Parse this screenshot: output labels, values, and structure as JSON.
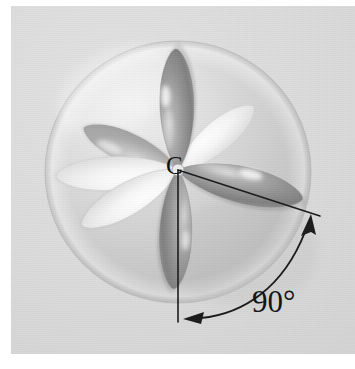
{
  "figure": {
    "kind": "molecular-orbital-illustration",
    "background_color": "#d8d8d8",
    "plate_border_color": "#ffffff"
  },
  "labels": {
    "center_atom": "C",
    "angle": "90°"
  },
  "annotations": {
    "vertical_reference_line": {
      "name": "vertical-reference-line",
      "from": [
        178,
        170
      ],
      "to": [
        178,
        322
      ],
      "color": "#1a1a1a"
    },
    "diagonal_bond_line": {
      "name": "diagonal-bond-line",
      "from": [
        178,
        170
      ],
      "to": [
        320,
        216
      ],
      "color": "#1a1a1a"
    },
    "angle_arc": {
      "name": "angle-arc",
      "start": [
        196,
        318
      ],
      "end": [
        308,
        224
      ],
      "arrowheads": [
        "start",
        "end"
      ],
      "color": "#1a1a1a",
      "measure": "90°"
    }
  },
  "sphere": {
    "name": "valence-sphere",
    "center": [
      178,
      172
    ],
    "radius_x": 132,
    "radius_y": 130,
    "fill": "#d0d0d0",
    "highlight": "#f0f0f0"
  },
  "lobes": [
    {
      "name": "lobe-up",
      "angle_deg": -90,
      "length": 122,
      "width": 62,
      "shade": "dark",
      "fill": "#949494"
    },
    {
      "name": "lobe-right",
      "angle_deg": 12,
      "length": 128,
      "width": 66,
      "shade": "dark",
      "fill": "#9a9a9a"
    },
    {
      "name": "lobe-down",
      "angle_deg": 92,
      "length": 120,
      "width": 58,
      "shade": "dark",
      "fill": "#8e8e8e"
    },
    {
      "name": "lobe-upper-left",
      "angle_deg": -156,
      "length": 104,
      "width": 52,
      "shade": "mid",
      "fill": "#b4b4b4"
    },
    {
      "name": "lobe-left",
      "angle_deg": 176,
      "length": 126,
      "width": 58,
      "shade": "light",
      "fill": "#f4f4f4"
    },
    {
      "name": "lobe-lower-left",
      "angle_deg": 152,
      "length": 112,
      "width": 56,
      "shade": "light",
      "fill": "#efefef"
    },
    {
      "name": "lobe-upper-right",
      "angle_deg": -38,
      "length": 96,
      "width": 50,
      "shade": "light",
      "fill": "#e8e8e8"
    }
  ]
}
